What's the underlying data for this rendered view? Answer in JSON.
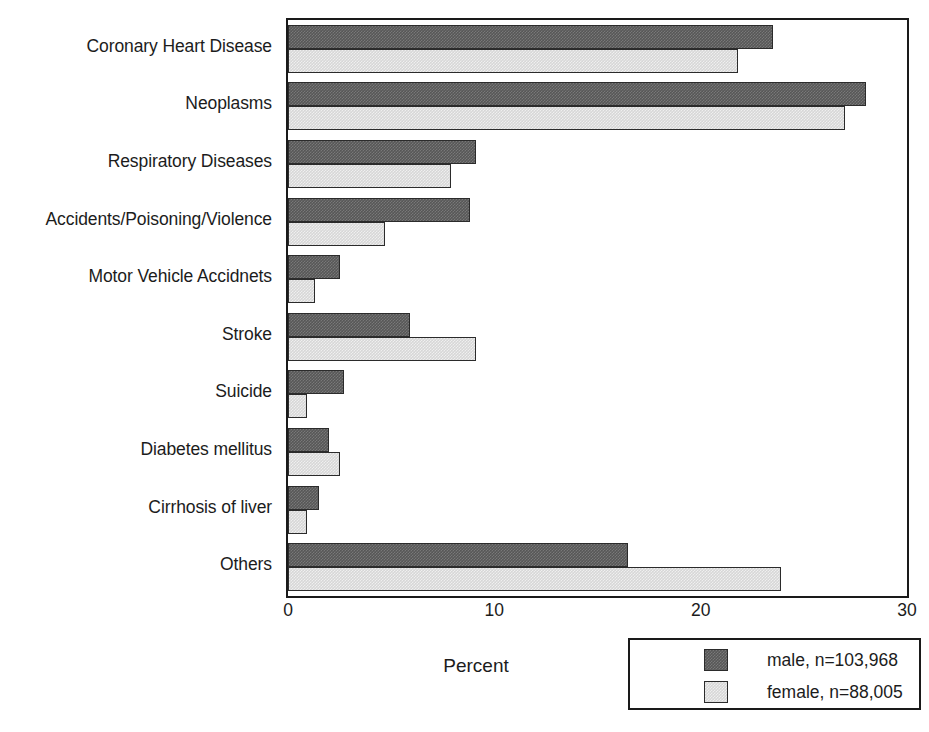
{
  "chart_data": {
    "type": "bar",
    "orientation": "horizontal",
    "title": "",
    "xlabel": "Percent",
    "ylabel": "",
    "xlim": [
      0,
      30
    ],
    "xticks": [
      0,
      10,
      20,
      30
    ],
    "xtick_labels": [
      "0",
      "10",
      "20",
      "30"
    ],
    "grid": false,
    "legend_position": "bottom-right",
    "categories": [
      "Coronary Heart Disease",
      "Neoplasms",
      "Respiratory Diseases",
      "Accidents/Poisoning/Violence",
      "Motor Vehicle Accidnets",
      "Stroke",
      "Suicide",
      "Diabetes mellitus",
      "Cirrhosis of liver",
      "Others"
    ],
    "series": [
      {
        "name": "male, n=103,968",
        "short_name": "male",
        "n": "103,968",
        "color": "#575757",
        "values": [
          23.5,
          28.0,
          9.1,
          8.8,
          2.5,
          5.9,
          2.7,
          2.0,
          1.5,
          16.5
        ]
      },
      {
        "name": "female, n=88,005",
        "short_name": "female",
        "n": "88,005",
        "color": "#d7d7d7",
        "values": [
          21.8,
          27.0,
          7.9,
          4.7,
          1.3,
          9.1,
          0.9,
          2.5,
          0.9,
          23.9
        ]
      }
    ]
  },
  "legend": {
    "entries": [
      {
        "label": "male, n=103,968",
        "swatch": "male"
      },
      {
        "label": "female, n=88,005",
        "swatch": "female"
      }
    ]
  }
}
